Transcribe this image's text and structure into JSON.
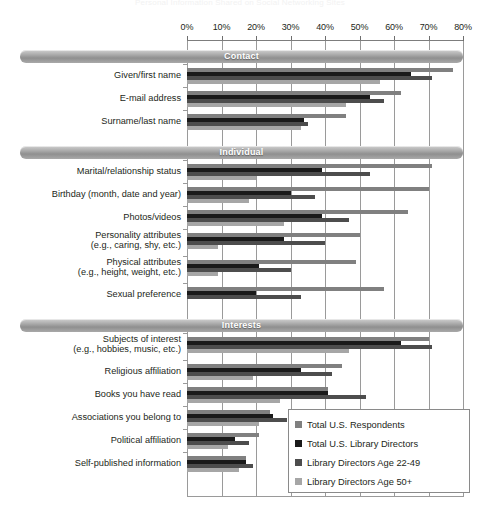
{
  "ghost_title": "Personal Information Shared on Social Networking Sites",
  "axis": {
    "ticks": [
      "0%",
      "10%",
      "20%",
      "30%",
      "40%",
      "50%",
      "60%",
      "70%",
      "80%"
    ],
    "min": 0,
    "max": 80,
    "step": 10
  },
  "legend": {
    "position": "inside-bottom-right",
    "entries": [
      {
        "label": "Total U.S. Respondents",
        "color": "#808080"
      },
      {
        "label": "Total U.S. Library Directors",
        "color": "#1a1a1a"
      },
      {
        "label": "Library Directors Age 22-49",
        "color": "#4d4d4d"
      },
      {
        "label": "Library Directors Age 50+",
        "color": "#a6a6a6"
      }
    ]
  },
  "sections": [
    {
      "title": "Contact"
    },
    {
      "title": "Individual"
    },
    {
      "title": "Interests"
    }
  ],
  "chart_data": {
    "type": "bar",
    "title": "Personal Information Shared on Social Networking Sites",
    "xlabel": "",
    "ylabel": "",
    "xlim": [
      0,
      80
    ],
    "grid": true,
    "orientation": "horizontal",
    "legend_position": "inside-bottom-right",
    "series": [
      {
        "name": "Total U.S. Respondents",
        "color": "#808080"
      },
      {
        "name": "Total U.S. Library Directors",
        "color": "#1a1a1a"
      },
      {
        "name": "Library Directors Age 22-49",
        "color": "#4d4d4d"
      },
      {
        "name": "Library Directors Age 50+",
        "color": "#a6a6a6"
      }
    ],
    "groups": [
      {
        "section": "Contact",
        "categories": [
          {
            "label": "Given/first name",
            "values": [
              77,
              65,
              71,
              56
            ]
          },
          {
            "label": "E-mail address",
            "values": [
              62,
              53,
              57,
              46
            ]
          },
          {
            "label": "Surname/last name",
            "values": [
              46,
              34,
              35,
              33
            ]
          }
        ]
      },
      {
        "section": "Individual",
        "categories": [
          {
            "label": "Marital/relationship status",
            "values": [
              71,
              39,
              53,
              20
            ]
          },
          {
            "label": "Birthday (month, date and year)",
            "values": [
              70,
              30,
              37,
              18
            ]
          },
          {
            "label": "Photos/videos",
            "values": [
              64,
              39,
              47,
              28
            ]
          },
          {
            "label": "Personality attributes\n(e.g., caring, shy, etc.)",
            "values": [
              50,
              28,
              40,
              9
            ]
          },
          {
            "label": "Physical attributes\n(e.g., height, weight, etc.)",
            "values": [
              49,
              21,
              30,
              9
            ]
          },
          {
            "label": "Sexual preference",
            "values": [
              57,
              20,
              33,
              0
            ]
          }
        ]
      },
      {
        "section": "Interests",
        "categories": [
          {
            "label": "Subjects of interest\n(e.g., hobbies, music, etc.)",
            "values": [
              70,
              62,
              71,
              47
            ]
          },
          {
            "label": "Religious affiliation",
            "values": [
              45,
              33,
              42,
              19
            ]
          },
          {
            "label": "Books you have read",
            "values": [
              41,
              41,
              52,
              27
            ]
          },
          {
            "label": "Associations you belong to",
            "values": [
              24,
              25,
              29,
              21
            ]
          },
          {
            "label": "Political affiliation",
            "values": [
              21,
              14,
              18,
              12
            ]
          },
          {
            "label": "Self-published information",
            "values": [
              17,
              17,
              19,
              15
            ]
          }
        ]
      }
    ]
  }
}
